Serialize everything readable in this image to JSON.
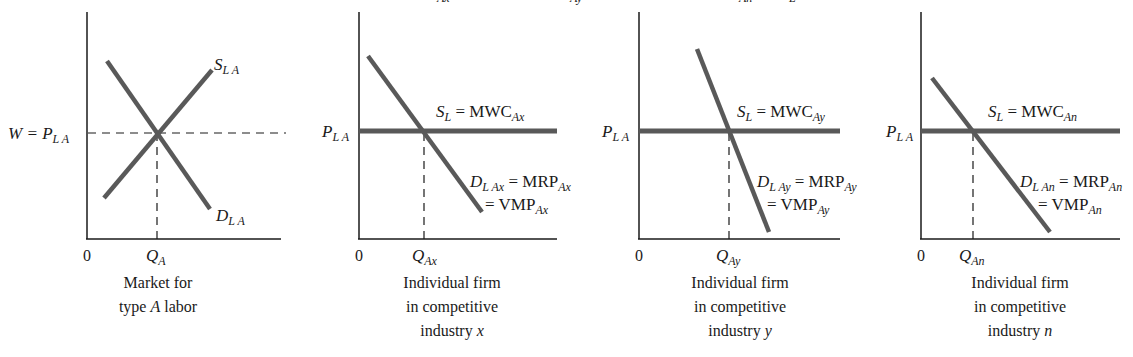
{
  "figure": {
    "top_cut_text": [
      "Ax",
      "Ay",
      "An",
      "L"
    ]
  },
  "panels": [
    {
      "id": "market",
      "y_label_main": "W = P",
      "y_label_sub": "L A",
      "origin": "0",
      "q_label_main": "Q",
      "q_label_sub": "A",
      "supply_main": "S",
      "supply_sub": "L A",
      "demand_main": "D",
      "demand_sub": "L A",
      "caption": [
        "Market for",
        "type ",
        "A",
        " labor"
      ]
    },
    {
      "id": "industry-x",
      "y_label_main": "P",
      "y_label_sub": "L A",
      "origin": "0",
      "q_label_main": "Q",
      "q_label_sub": "Ax",
      "supply_s": "S",
      "supply_s_sub": "L",
      "supply_eq": " = MWC",
      "supply_sub": "Ax",
      "demand_main": "D",
      "demand_sub": "L Ax",
      "demand_eq": " = MRP",
      "demand_eq_sub": "Ax",
      "vmp_eq": "= VMP",
      "vmp_sub": "Ax",
      "caption": [
        "Individual firm",
        "in competitive",
        "industry ",
        "x"
      ]
    },
    {
      "id": "industry-y",
      "y_label_main": "P",
      "y_label_sub": "L A",
      "origin": "0",
      "q_label_main": "Q",
      "q_label_sub": "Ay",
      "supply_s": "S",
      "supply_s_sub": "L",
      "supply_eq": " = MWC",
      "supply_sub": "Ay",
      "demand_main": "D",
      "demand_sub": "L Ay",
      "demand_eq": " = MRP",
      "demand_eq_sub": "Ay",
      "vmp_eq": "= VMP",
      "vmp_sub": "Ay",
      "caption": [
        "Individual firm",
        "in competitive",
        "industry ",
        "y"
      ]
    },
    {
      "id": "industry-n",
      "y_label_main": "P",
      "y_label_sub": "L A",
      "origin": "0",
      "q_label_main": "Q",
      "q_label_sub": "An",
      "supply_s": "S",
      "supply_s_sub": "L",
      "supply_eq": " = MWC",
      "supply_sub": "An",
      "demand_main": "D",
      "demand_sub": "L An",
      "demand_eq": " = MRP",
      "demand_eq_sub": "An",
      "vmp_eq": "= VMP",
      "vmp_sub": "An",
      "caption": [
        "Individual firm",
        "in competitive",
        "industry ",
        "n"
      ]
    }
  ],
  "colors": {
    "curve": "#595959",
    "axis": "#1a1a1a",
    "background": "#ffffff"
  }
}
